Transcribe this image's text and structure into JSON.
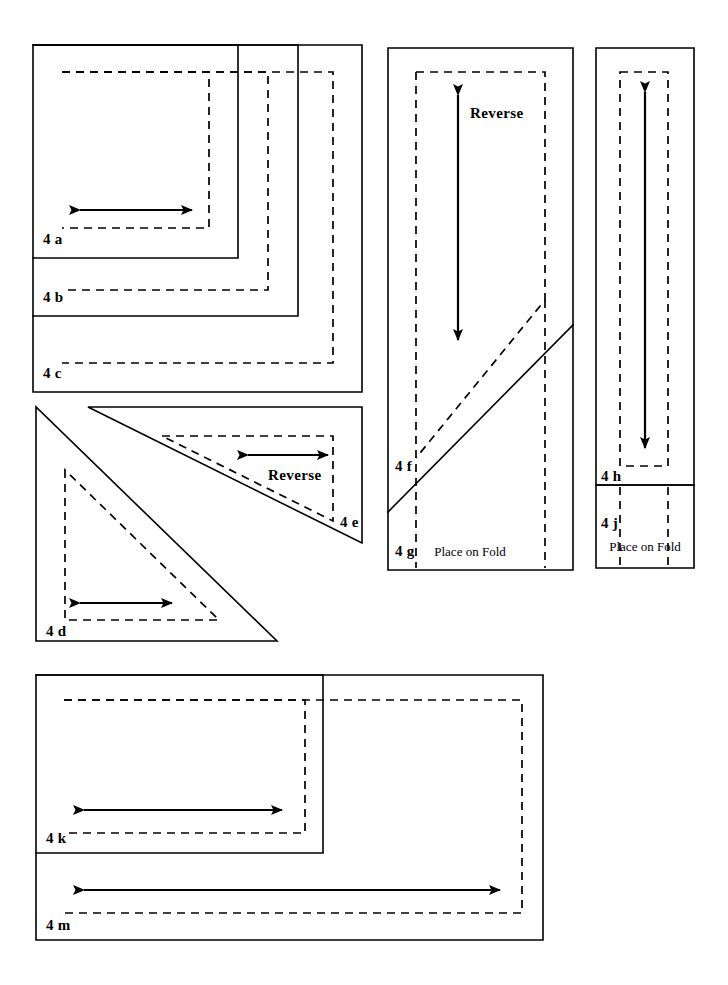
{
  "sheet": {
    "title": "Pattern Sheet 4",
    "description": "Sewing pattern cutting layout sheet with nested solid cutting lines and dashed seam lines",
    "background_color": "#ffffff",
    "line_color": "#000000",
    "width": 728,
    "height": 985
  },
  "legend": {
    "cut_line_style": "solid",
    "seam_line_style": "dashed",
    "grainline_style": "double-headed arrow"
  },
  "groups": [
    {
      "id": "group-nested-rectangles",
      "name": "Nested rectangles 4a 4b 4c",
      "pieces": [
        "4 a",
        "4 b",
        "4 c"
      ]
    },
    {
      "id": "group-triangles",
      "name": "Triangles 4d 4e",
      "pieces": [
        "4 d",
        "4 e"
      ]
    },
    {
      "id": "group-fold-panel",
      "name": "Fold panel 4f 4g",
      "pieces": [
        "4 f",
        "4 g"
      ]
    },
    {
      "id": "group-narrow-panel",
      "name": "Narrow panel 4h 4j",
      "pieces": [
        "4 h",
        "4 j"
      ]
    },
    {
      "id": "group-bottom-rectangles",
      "name": "Bottom rectangles 4k 4m",
      "pieces": [
        "4 k",
        "4 m"
      ]
    }
  ],
  "labels": {
    "piece_4a": "4 a",
    "piece_4b": "4 b",
    "piece_4c": "4 c",
    "piece_4d": "4 d",
    "piece_4e": "4 e",
    "piece_4f": "4 f",
    "piece_4g": "4 g",
    "piece_4h": "4 h",
    "piece_4j": "4 j",
    "piece_4k": "4 k",
    "piece_4m": "4 m",
    "reverse_triangle": "Reverse",
    "reverse_panel": "Reverse",
    "place_on_fold_4g": "Place on Fold",
    "place_on_fold_4j": "Place on Fold"
  }
}
